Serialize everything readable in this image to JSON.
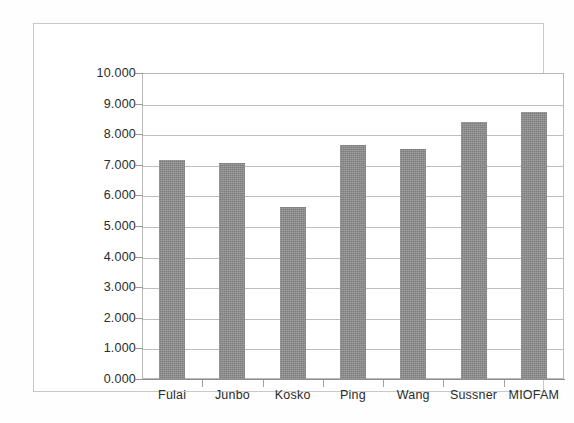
{
  "chart_data": {
    "type": "bar",
    "title": "",
    "subtitle": "",
    "xlabel": "",
    "ylabel": "",
    "categories": [
      "Fulai",
      "Junbo",
      "Kosko",
      "Ping",
      "Wang",
      "Sussner",
      "MIOFAM"
    ],
    "values": [
      7.15,
      7.05,
      5.62,
      7.65,
      7.53,
      8.4,
      8.73
    ],
    "series": [
      {
        "name": "",
        "values": [
          7.15,
          7.05,
          5.62,
          7.65,
          7.53,
          8.4,
          8.73
        ]
      }
    ],
    "ylim": [
      0.0,
      10.0
    ],
    "ytick_step": 1.0,
    "ytick_labels": [
      "10.000",
      "9.000",
      "8.000",
      "7.000",
      "6.000",
      "5.000",
      "4.000",
      "3.000",
      "2.000",
      "1.000",
      "0.000"
    ],
    "ytick_values": [
      10,
      9,
      8,
      7,
      6,
      5,
      4,
      3,
      2,
      1,
      0
    ],
    "grid": true,
    "grid_axis": "y",
    "legend": false,
    "legend_position": "none",
    "bar_color": "#8a8a8a",
    "gridline_color": "#bdbdbd",
    "axis_color": "#8f8f8f",
    "plot_background": "#ffffff",
    "frame_color": "#c8c8c8"
  }
}
